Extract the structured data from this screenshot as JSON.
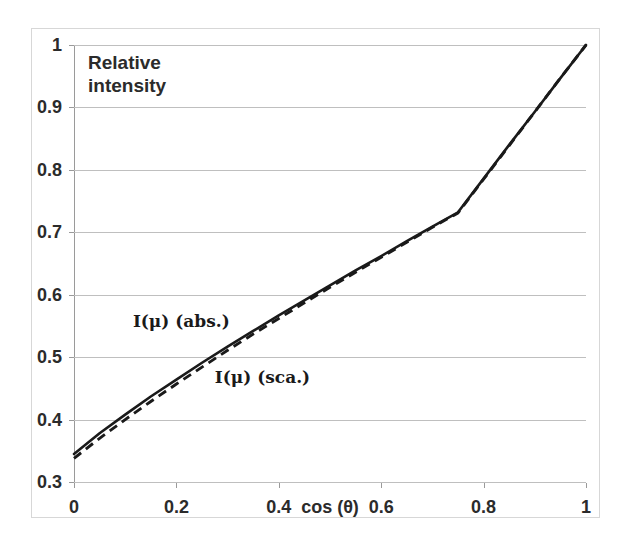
{
  "chart_data": {
    "type": "line",
    "title": "",
    "xlabel": "cos (θ)",
    "ylabel": "Relative intensity",
    "ylabel_line1": "Relative",
    "ylabel_line2": "intensity",
    "xlim": [
      0,
      1
    ],
    "ylim": [
      0.3,
      1
    ],
    "grid": true,
    "legend_position": "inline-annotations",
    "xticks": [
      "0",
      "0.2",
      "0.4",
      "0.6",
      "0.8",
      "1"
    ],
    "xtick_values": [
      0,
      0.2,
      0.4,
      0.6,
      0.8,
      1
    ],
    "yticks": [
      "0.3",
      "0.4",
      "0.5",
      "0.6",
      "0.7",
      "0.8",
      "0.9",
      "1"
    ],
    "ytick_values": [
      0.3,
      0.4,
      0.5,
      0.6,
      0.7,
      0.8,
      0.9,
      1
    ],
    "x": [
      0,
      0.05,
      0.1,
      0.15,
      0.2,
      0.25,
      0.3,
      0.35,
      0.4,
      0.45,
      0.5,
      0.55,
      0.6,
      0.65,
      0.7,
      0.75,
      0.8,
      0.85,
      0.9,
      0.95,
      1
    ],
    "series": [
      {
        "name": "I(μ)  (abs.)",
        "style": "solid",
        "color": "#1a1a1a",
        "values": [
          0.345,
          0.378,
          0.408,
          0.437,
          0.464,
          0.491,
          0.517,
          0.542,
          0.567,
          0.591,
          0.615,
          0.639,
          0.662,
          0.686,
          0.709,
          0.732,
          0.786,
          0.84,
          0.893,
          0.947,
          1.0
        ]
      },
      {
        "name": "I(μ)  (sca.)",
        "style": "dashed",
        "color": "#1a1a1a",
        "values": [
          0.338,
          0.37,
          0.4,
          0.429,
          0.457,
          0.484,
          0.511,
          0.537,
          0.562,
          0.587,
          0.612,
          0.636,
          0.66,
          0.684,
          0.708,
          0.731,
          0.785,
          0.839,
          0.893,
          0.947,
          1.0
        ]
      }
    ],
    "annotations": [
      {
        "text": "I(μ)  (abs.)",
        "x": 0.115,
        "y": 0.556
      },
      {
        "text": "I(μ)  (sca.)",
        "x": 0.275,
        "y": 0.466
      }
    ]
  }
}
